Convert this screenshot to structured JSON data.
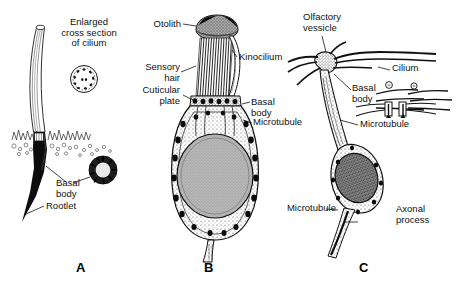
{
  "figure": {
    "background": "#ffffff",
    "ink": "#111111",
    "panels": [
      {
        "letter": "A",
        "name": "ciliated-sensory-cell",
        "labels": [
          {
            "id": "enlarged-cross-section",
            "text": "Enlarged\ncross section\nof cilium"
          },
          {
            "id": "basal-body",
            "text": "Basal\nbody"
          },
          {
            "id": "rootlet",
            "text": "Rootlet"
          }
        ],
        "insets": [
          {
            "id": "axoneme-cross-section",
            "note": "9+2 microtubule doublet ring"
          },
          {
            "id": "basal-body-cross-section",
            "note": "nine triplet ring"
          }
        ]
      },
      {
        "letter": "B",
        "name": "otolith-hair-cell",
        "labels": [
          {
            "id": "otolith",
            "text": "Otolith"
          },
          {
            "id": "kinocilium",
            "text": "Kinocilium"
          },
          {
            "id": "sensory-hair",
            "text": "Sensory\nhair"
          },
          {
            "id": "cuticular-plate",
            "text": "Cuticular\nplate"
          },
          {
            "id": "basal-body",
            "text": "Basal\nbody"
          },
          {
            "id": "microtubule",
            "text": "Microtubule"
          }
        ]
      },
      {
        "letter": "C",
        "name": "olfactory-receptor-cell",
        "labels": [
          {
            "id": "olfactory-vessicle",
            "text": "Olfactory\nvessicle"
          },
          {
            "id": "cilium",
            "text": "Cilium"
          },
          {
            "id": "basal-body",
            "text": "Basal\nbody"
          },
          {
            "id": "microtubule-upper",
            "text": "Microtubule"
          },
          {
            "id": "microtubule-lower",
            "text": "Microtubule"
          },
          {
            "id": "axonal-process",
            "text": "Axonal\nprocess"
          }
        ]
      }
    ]
  }
}
